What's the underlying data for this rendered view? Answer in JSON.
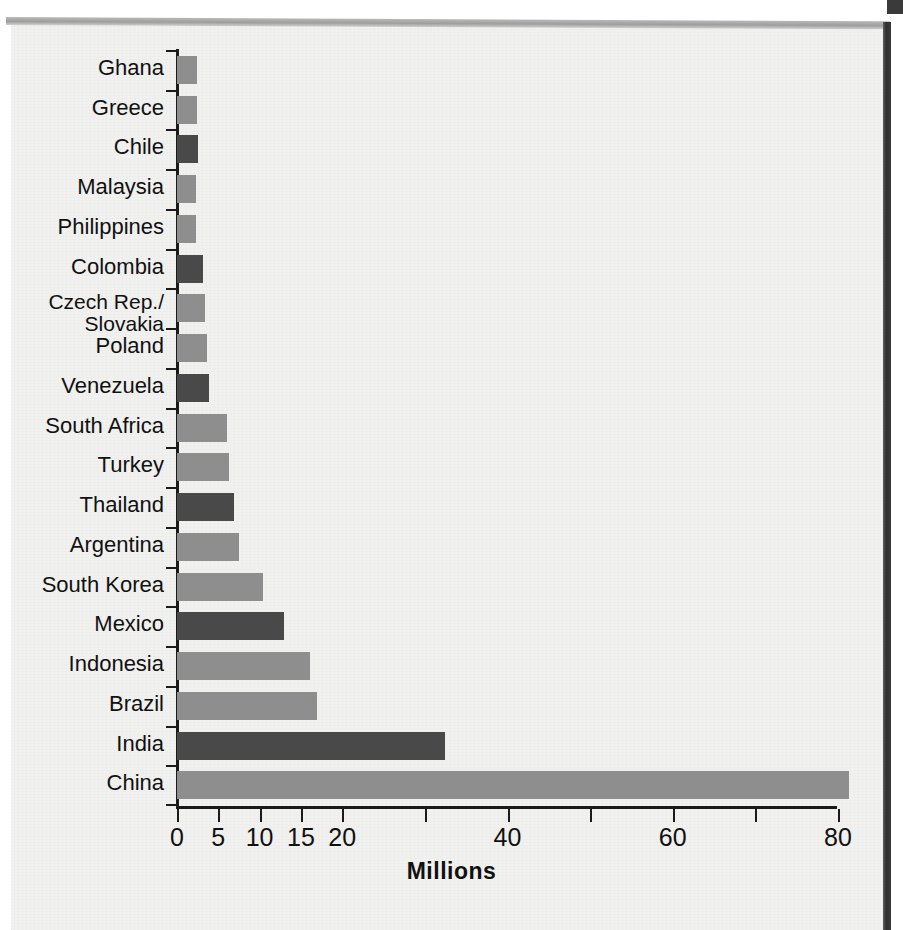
{
  "chart_data": {
    "type": "bar",
    "orientation": "horizontal",
    "title": "",
    "xlabel": "Millions",
    "ylabel": "",
    "xlim": [
      0,
      81.5
    ],
    "grid": false,
    "legend": null,
    "xticks": [
      {
        "value": 0,
        "label": "0"
      },
      {
        "value": 5,
        "label": "5"
      },
      {
        "value": 10,
        "label": "10"
      },
      {
        "value": 15,
        "label": "15"
      },
      {
        "value": 20,
        "label": "20"
      },
      {
        "value": 30,
        "label": ""
      },
      {
        "value": 40,
        "label": "40"
      },
      {
        "value": 50,
        "label": ""
      },
      {
        "value": 60,
        "label": "60"
      },
      {
        "value": 70,
        "label": ""
      },
      {
        "value": 80,
        "label": "80"
      }
    ],
    "categories": [
      "Ghana",
      "Greece",
      "Chile",
      "Malaysia",
      "Philippines",
      "Colombia",
      "Czech Rep./\nSlovakia",
      "Poland",
      "Venezuela",
      "South Africa",
      "Turkey",
      "Thailand",
      "Argentina",
      "South Korea",
      "Mexico",
      "Indonesia",
      "Brazil",
      "India",
      "China"
    ],
    "values": [
      2.4,
      2.4,
      2.5,
      2.3,
      2.3,
      3.2,
      3.4,
      3.6,
      3.9,
      6.1,
      6.3,
      6.9,
      7.5,
      10.4,
      13.0,
      16.1,
      17.0,
      32.4,
      81.3
    ],
    "bar_shades": [
      "light",
      "light",
      "dark",
      "light",
      "light",
      "dark",
      "light",
      "light",
      "dark",
      "light",
      "light",
      "dark",
      "light",
      "light",
      "dark",
      "light",
      "light",
      "dark",
      "light"
    ],
    "colors": {
      "bar_light": "#8e8e8e",
      "bar_dark": "#494949",
      "axis": "#1b1b1b",
      "text": "#111111",
      "paper": "#f1f1ef"
    }
  },
  "bars": [
    {
      "label": "Ghana",
      "value": 2.4,
      "shade": "light"
    },
    {
      "label": "Greece",
      "value": 2.4,
      "shade": "light"
    },
    {
      "label": "Chile",
      "value": 2.5,
      "shade": "dark"
    },
    {
      "label": "Malaysia",
      "value": 2.3,
      "shade": "light"
    },
    {
      "label": "Philippines",
      "value": 2.3,
      "shade": "light"
    },
    {
      "label": "Colombia",
      "value": 3.2,
      "shade": "dark"
    },
    {
      "label": "Czech Rep./Slovakia",
      "value": 3.4,
      "shade": "light",
      "line1": "Czech Rep./",
      "line2": "Slovakia"
    },
    {
      "label": "Poland",
      "value": 3.6,
      "shade": "light"
    },
    {
      "label": "Venezuela",
      "value": 3.9,
      "shade": "dark"
    },
    {
      "label": "South Africa",
      "value": 6.1,
      "shade": "light"
    },
    {
      "label": "Turkey",
      "value": 6.3,
      "shade": "light"
    },
    {
      "label": "Thailand",
      "value": 6.9,
      "shade": "dark"
    },
    {
      "label": "Argentina",
      "value": 7.5,
      "shade": "light"
    },
    {
      "label": "South Korea",
      "value": 10.4,
      "shade": "light"
    },
    {
      "label": "Mexico",
      "value": 13.0,
      "shade": "dark"
    },
    {
      "label": "Indonesia",
      "value": 16.1,
      "shade": "light"
    },
    {
      "label": "Brazil",
      "value": 17.0,
      "shade": "light"
    },
    {
      "label": "India",
      "value": 32.4,
      "shade": "dark"
    },
    {
      "label": "China",
      "value": 81.3,
      "shade": "light"
    }
  ],
  "axis": {
    "x_title": "Millions",
    "tick_labels": [
      "0",
      "5",
      "10",
      "15",
      "20",
      "40",
      "60",
      "80"
    ]
  }
}
